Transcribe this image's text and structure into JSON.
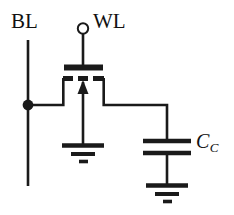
{
  "figure": {
    "kind": "circuit-schematic",
    "background_color": "#ffffff",
    "line_color": "#1a1a1a"
  },
  "labels": {
    "bit_line": "BL",
    "word_line": "WL",
    "capacitor": "C",
    "capacitor_subscript": "C"
  },
  "nodes": {
    "bit_line_junction_dot": "filled-junction-dot",
    "word_line_terminal": "open-circle-terminal"
  },
  "components": [
    {
      "name": "bit-line",
      "type": "wire",
      "label": "BL"
    },
    {
      "name": "word-line-terminal",
      "type": "open-terminal",
      "label": "WL"
    },
    {
      "name": "access-transistor",
      "type": "mosfet",
      "gate": "solid-plate",
      "channel": "dashed-enhancement",
      "bulk": "arrow-up"
    },
    {
      "name": "coupling-capacitor",
      "type": "capacitor",
      "label": "C_C"
    },
    {
      "name": "transistor-ground",
      "type": "ground",
      "bars": 3
    },
    {
      "name": "capacitor-ground",
      "type": "ground",
      "bars": 3
    }
  ]
}
